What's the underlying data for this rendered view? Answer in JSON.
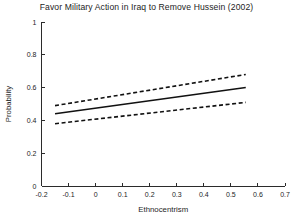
{
  "chart_data": {
    "type": "line",
    "title": "Favor Military Action in Iraq to Remove Hussein (2002)",
    "xlabel": "Ethnocentrism",
    "ylabel": "Probability",
    "xlim": [
      -0.2,
      0.7
    ],
    "ylim": [
      0,
      1
    ],
    "xticks": [
      -0.2,
      -0.1,
      0,
      0.1,
      0.2,
      0.3,
      0.4,
      0.5,
      0.6,
      0.7
    ],
    "xticklabels": [
      "-0.2",
      "-0.1",
      "0",
      "0.1",
      "0.2",
      "0.3",
      "0.4",
      "0.5",
      "0.6",
      "0.7"
    ],
    "yticks": [
      0,
      0.2,
      0.4,
      0.6,
      0.8,
      1
    ],
    "yticklabels": [
      "0",
      "0.2",
      "0.4",
      "0.6",
      "0.8",
      "1"
    ],
    "grid": false,
    "legend": "none",
    "x": [
      -0.15,
      0.555
    ],
    "series": [
      {
        "name": "Upper confidence bound",
        "style": "dashed",
        "color": "#111111",
        "values": [
          0.49,
          0.68
        ]
      },
      {
        "name": "Predicted probability",
        "style": "solid",
        "color": "#111111",
        "values": [
          0.44,
          0.6
        ]
      },
      {
        "name": "Lower confidence bound",
        "style": "dashed",
        "color": "#111111",
        "values": [
          0.38,
          0.51
        ]
      }
    ]
  }
}
